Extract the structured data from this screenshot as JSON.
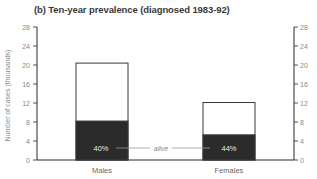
{
  "chart_data": {
    "type": "bar",
    "title": "(b) Ten-year prevalence (diagnosed 1983-92)",
    "ylabel": "Number of cases (thousands)",
    "xlabel": "",
    "ylim": [
      0,
      28
    ],
    "yticks": [
      0,
      4,
      8,
      12,
      16,
      20,
      24,
      28
    ],
    "categories": [
      "Males",
      "Females"
    ],
    "series": [
      {
        "name": "total",
        "values": [
          20.4,
          12.1
        ],
        "color": "#ffffff"
      },
      {
        "name": "alive",
        "values": [
          8.2,
          5.3
        ],
        "color": "#2b2b2b"
      }
    ],
    "annotations": {
      "percent_alive": [
        "40%",
        "44%"
      ],
      "alive_label": "alive"
    },
    "grid": false,
    "right_axis": true
  },
  "colors": {
    "axis": "#2a2a2a",
    "alive_fill": "#2b2b2b",
    "bar_outline": "#3a3a3a",
    "tick_text": "#8a8a8a"
  }
}
